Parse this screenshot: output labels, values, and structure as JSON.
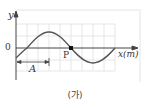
{
  "figure": {
    "caption": "(가)",
    "axes": {
      "y_label": "y",
      "x_label": "x(m)",
      "origin_label": "0"
    },
    "point": {
      "label": "P"
    },
    "dimension": {
      "label": "A"
    },
    "colors": {
      "wave": "#555555",
      "grid": "#dddddd",
      "axis": "#444444",
      "frame": "#e2e2e2"
    }
  }
}
